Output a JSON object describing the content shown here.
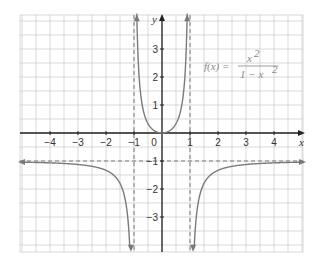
{
  "chart_data": {
    "type": "line",
    "title": "",
    "function_label": "f(x) = x^2 / (1 - x^2)",
    "formula": {
      "lhs": "f(x) =",
      "numerator": "x",
      "numerator_exp": "2",
      "denominator": "1 − x",
      "denominator_exp": "2"
    },
    "xlabel": "x",
    "ylabel": "y",
    "xlim": [
      -5,
      5
    ],
    "ylim": [
      -4.2,
      4.2
    ],
    "x_ticks": [
      -4,
      -3,
      -2,
      -1,
      0,
      1,
      2,
      3,
      4
    ],
    "x_tick_labels": [
      "−4",
      "−3",
      "−2",
      "−1",
      "0",
      "1",
      "2",
      "3",
      "4"
    ],
    "y_ticks": [
      -3,
      -2,
      -1,
      1,
      2,
      3
    ],
    "y_tick_labels": [
      "−3",
      "−2",
      "−1",
      "1",
      "2",
      "3"
    ],
    "grid": true,
    "grid_step": 0.5,
    "asymptotes": {
      "vertical": [
        -1,
        1
      ],
      "horizontal": [
        -1
      ]
    },
    "series": [
      {
        "name": "left branch (x < -1)",
        "x": [
          -5,
          -4,
          -3,
          -2,
          -1.5,
          -1.3,
          -1.2,
          -1.15,
          -1.1
        ],
        "y": [
          -1.04,
          -1.07,
          -1.13,
          -1.33,
          -1.8,
          -2.45,
          -3.27,
          -3.93,
          -5.0
        ]
      },
      {
        "name": "middle branch (-1 < x < 1)",
        "x": [
          -0.97,
          -0.9,
          -0.8,
          -0.6,
          -0.4,
          -0.2,
          0,
          0.2,
          0.4,
          0.6,
          0.8,
          0.9,
          0.97
        ],
        "y": [
          15.9,
          4.26,
          1.78,
          0.56,
          0.19,
          0.04,
          0,
          0.04,
          0.19,
          0.56,
          1.78,
          4.26,
          15.9
        ]
      },
      {
        "name": "right branch (x > 1)",
        "x": [
          1.1,
          1.15,
          1.2,
          1.3,
          1.5,
          2,
          3,
          4,
          5
        ],
        "y": [
          -5.0,
          -3.93,
          -3.27,
          -2.45,
          -1.8,
          -1.33,
          -1.13,
          -1.07,
          -1.04
        ]
      }
    ],
    "colors": {
      "curve": "#7a7a7a",
      "axis": "#222222",
      "grid": "#cfcfcf",
      "asymptote": "#7a7a7a"
    }
  }
}
